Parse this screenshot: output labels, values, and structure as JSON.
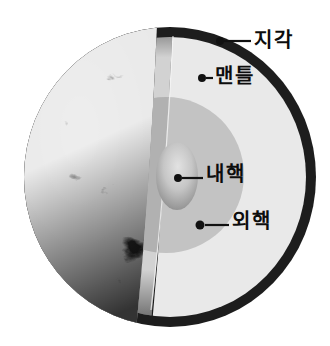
{
  "diagram": {
    "type": "earth-interior-cutaway",
    "labels": [
      {
        "id": "crust",
        "text": "지각"
      },
      {
        "id": "mantle",
        "text": "맨틀"
      },
      {
        "id": "inner-core",
        "text": "내핵"
      },
      {
        "id": "outer-core",
        "text": "외핵"
      }
    ],
    "colors": {
      "background": "#ffffff",
      "crust": "#1d1d1d",
      "mantle_face": "#e9e9e9",
      "mantle_side": "#d2d2d2",
      "outer_core_face": "#c3c3c3",
      "outer_core_side": "#b1b1b1",
      "inner_core_highlight": "#e2e2e2",
      "inner_core_shadow": "#646464",
      "leader": "#111111"
    }
  }
}
